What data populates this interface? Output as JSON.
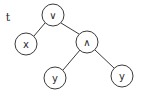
{
  "diagram": {
    "type": "tree",
    "title": "t",
    "nodes": [
      {
        "id": "root",
        "label": "∨",
        "x": 53,
        "y": 15
      },
      {
        "id": "x",
        "label": "x",
        "x": 26,
        "y": 44
      },
      {
        "id": "and",
        "label": "∧",
        "x": 87,
        "y": 42
      },
      {
        "id": "y1",
        "label": "y",
        "x": 55,
        "y": 78
      },
      {
        "id": "y2",
        "label": "y",
        "x": 122,
        "y": 76
      }
    ],
    "edges": [
      {
        "from": "root",
        "to": "x"
      },
      {
        "from": "root",
        "to": "and"
      },
      {
        "from": "and",
        "to": "y1"
      },
      {
        "from": "and",
        "to": "y2"
      }
    ],
    "node_radius": 11,
    "colors": {
      "stroke": "#3a3a3a",
      "text": "#2a2a2a",
      "background": "#ffffff"
    }
  }
}
